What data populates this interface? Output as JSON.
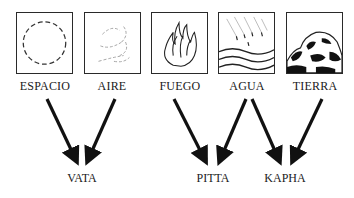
{
  "elements": [
    {
      "id": "espacio",
      "label": "ESPACIO",
      "icon": "dashed-circle-icon"
    },
    {
      "id": "aire",
      "label": "AIRE",
      "icon": "wind-swirl-icon"
    },
    {
      "id": "fuego",
      "label": "FUEGO",
      "icon": "flame-icon"
    },
    {
      "id": "agua",
      "label": "AGUA",
      "icon": "rain-waves-icon"
    },
    {
      "id": "tierra",
      "label": "TIERRA",
      "icon": "rock-icon"
    }
  ],
  "doshas": [
    {
      "id": "vata",
      "label": "VATA"
    },
    {
      "id": "pitta",
      "label": "PITTA"
    },
    {
      "id": "kapha",
      "label": "KAPHA"
    }
  ],
  "connections": [
    {
      "from": "ESPACIO",
      "to": "VATA"
    },
    {
      "from": "AIRE",
      "to": "VATA"
    },
    {
      "from": "FUEGO",
      "to": "PITTA"
    },
    {
      "from": "AGUA",
      "to": "PITTA"
    },
    {
      "from": "AGUA",
      "to": "KAPHA"
    },
    {
      "from": "TIERRA",
      "to": "KAPHA"
    }
  ]
}
